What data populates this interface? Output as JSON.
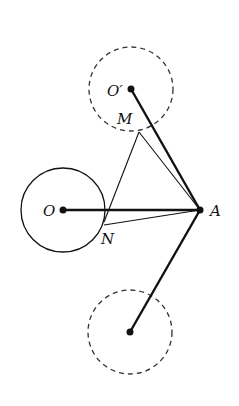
{
  "diagram": {
    "labels": {
      "O_prime": "O′",
      "M": "M",
      "O": "O",
      "A": "A",
      "N": "N"
    },
    "points": {
      "O_prime": [
        131,
        89
      ],
      "M": [
        139,
        132
      ],
      "O": [
        63,
        210
      ],
      "A": [
        200,
        210
      ],
      "N": [
        105,
        225
      ],
      "P": [
        106,
        210
      ],
      "O_double_prime": [
        130,
        332
      ]
    },
    "circles": [
      {
        "name": "circle-O",
        "center": [
          63,
          210
        ],
        "r": 42,
        "style": "solid"
      },
      {
        "name": "circle-O-prime",
        "center": [
          131,
          89
        ],
        "r": 42,
        "style": "dashed"
      },
      {
        "name": "circle-O-double-prime",
        "center": [
          130,
          332
        ],
        "r": 42,
        "style": "dashed"
      }
    ],
    "colors": {
      "stroke": "#111111",
      "background": "#ffffff"
    }
  }
}
